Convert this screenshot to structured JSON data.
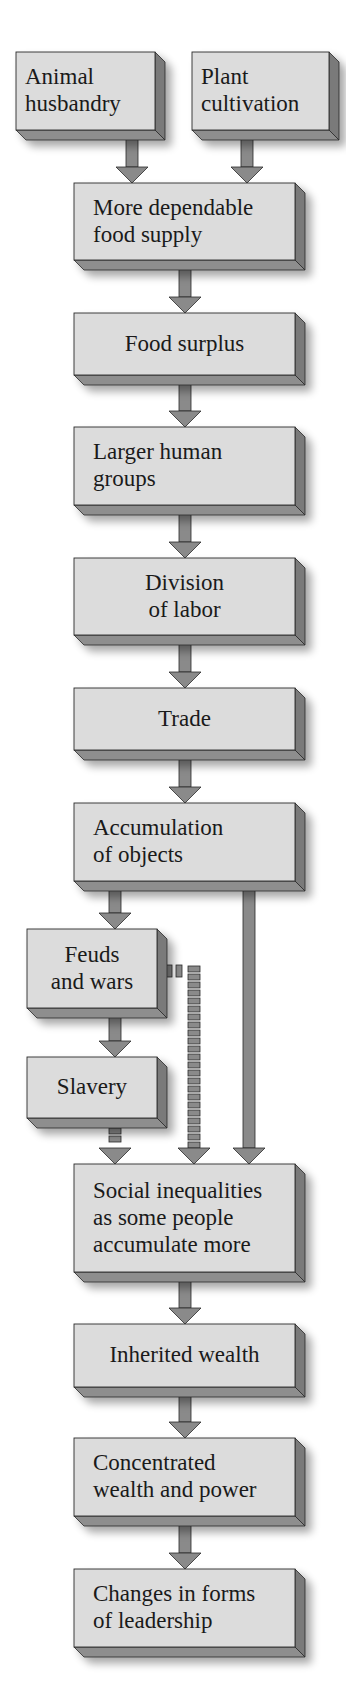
{
  "title_fragment": "",
  "colors": {
    "front": "#dcdcdc",
    "side": "#7a7a7a",
    "bottom": "#8e8e8e",
    "arrow": "#8a8a8a",
    "outline": "#2a2a2a",
    "text": "#1a1a1a"
  },
  "nodes": [
    {
      "id": "animal",
      "label": "Animal\nhusbandry",
      "x": 16,
      "y": 52,
      "w": 139,
      "h": 78,
      "align": "left"
    },
    {
      "id": "plant",
      "label": "Plant\ncultivation",
      "x": 192,
      "y": 52,
      "w": 137,
      "h": 78,
      "align": "left"
    },
    {
      "id": "food-supply",
      "label": "More dependable\nfood supply",
      "x": 74,
      "y": 183,
      "w": 221,
      "h": 77,
      "align": "left"
    },
    {
      "id": "surplus",
      "label": "Food surplus",
      "x": 74,
      "y": 313,
      "w": 221,
      "h": 62,
      "align": "center"
    },
    {
      "id": "groups",
      "label": "Larger human\ngroups",
      "x": 74,
      "y": 427,
      "w": 221,
      "h": 78,
      "align": "left"
    },
    {
      "id": "division",
      "label": "Division\nof labor",
      "x": 74,
      "y": 558,
      "w": 221,
      "h": 77,
      "align": "center"
    },
    {
      "id": "trade",
      "label": "Trade",
      "x": 74,
      "y": 688,
      "w": 221,
      "h": 62,
      "align": "center"
    },
    {
      "id": "accumulation",
      "label": "Accumulation\nof objects",
      "x": 74,
      "y": 803,
      "w": 221,
      "h": 78,
      "align": "left"
    },
    {
      "id": "feuds",
      "label": "Feuds\nand wars",
      "x": 27,
      "y": 929,
      "w": 130,
      "h": 79,
      "align": "center"
    },
    {
      "id": "slavery",
      "label": "Slavery",
      "x": 27,
      "y": 1057,
      "w": 130,
      "h": 61,
      "align": "center"
    },
    {
      "id": "inequalities",
      "label": "Social inequalities\nas some people\naccumulate more",
      "x": 74,
      "y": 1164,
      "w": 221,
      "h": 108,
      "align": "left"
    },
    {
      "id": "inherited",
      "label": "Inherited wealth",
      "x": 74,
      "y": 1324,
      "w": 221,
      "h": 63,
      "align": "center"
    },
    {
      "id": "concentrated",
      "label": "Concentrated\nwealth and power",
      "x": 74,
      "y": 1438,
      "w": 221,
      "h": 78,
      "align": "left"
    },
    {
      "id": "leadership",
      "label": "Changes in forms\nof leadership",
      "x": 74,
      "y": 1569,
      "w": 221,
      "h": 78,
      "align": "left"
    }
  ],
  "edges": [
    {
      "from": "animal",
      "to": "food-supply",
      "style": "solid",
      "x": 132,
      "y1": 141,
      "y2": 183
    },
    {
      "from": "plant",
      "to": "food-supply",
      "style": "solid",
      "x": 247,
      "y1": 141,
      "y2": 183
    },
    {
      "from": "food-supply",
      "to": "surplus",
      "style": "solid",
      "x": 185,
      "y1": 271,
      "y2": 313
    },
    {
      "from": "surplus",
      "to": "groups",
      "style": "solid",
      "x": 185,
      "y1": 386,
      "y2": 427
    },
    {
      "from": "groups",
      "to": "division",
      "style": "solid",
      "x": 185,
      "y1": 516,
      "y2": 558
    },
    {
      "from": "division",
      "to": "trade",
      "style": "solid",
      "x": 185,
      "y1": 646,
      "y2": 688
    },
    {
      "from": "trade",
      "to": "accumulation",
      "style": "solid",
      "x": 185,
      "y1": 761,
      "y2": 803
    },
    {
      "from": "accumulation",
      "to": "feuds",
      "style": "solid",
      "x": 115,
      "y1": 892,
      "y2": 929
    },
    {
      "from": "accumulation",
      "to": "inequalities",
      "style": "solid",
      "x": 249,
      "y1": 892,
      "y2": 1164
    },
    {
      "from": "feuds",
      "to": "slavery",
      "style": "solid",
      "x": 115,
      "y1": 1019,
      "y2": 1057
    },
    {
      "from": "feuds",
      "to": "inequalities",
      "style": "dashed",
      "x": 194,
      "y1": 966,
      "y2": 1164
    },
    {
      "from": "slavery",
      "to": "inequalities",
      "style": "dashed",
      "x": 115,
      "y1": 1120,
      "y2": 1164
    },
    {
      "from": "inequalities",
      "to": "inherited",
      "style": "solid",
      "x": 185,
      "y1": 1283,
      "y2": 1324
    },
    {
      "from": "inherited",
      "to": "concentrated",
      "style": "solid",
      "x": 185,
      "y1": 1398,
      "y2": 1438
    },
    {
      "from": "concentrated",
      "to": "leadership",
      "style": "solid",
      "x": 185,
      "y1": 1527,
      "y2": 1569
    }
  ]
}
